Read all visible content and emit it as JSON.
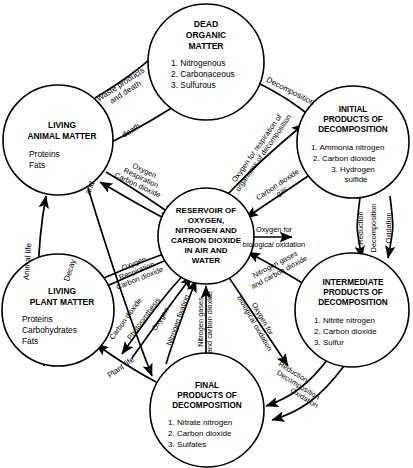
{
  "diagram": {
    "type": "cycle-diagram",
    "colors": {
      "stroke": "#000000",
      "background": "#ffffff",
      "text": "#000000"
    },
    "nodes": [
      {
        "id": "dead-organic-matter",
        "title": [
          "DEAD",
          "ORGANIC",
          "MATTER"
        ],
        "items": [
          "1. Nitrogenous",
          "2. Carbonaceous",
          "3. Sulfurous"
        ],
        "cx": 206,
        "cy": 62,
        "r": 58
      },
      {
        "id": "initial-products-of-decomposition",
        "title": [
          "INITIAL",
          "PRODUCTS OF",
          "DECOMPOSITION"
        ],
        "items": [
          "1. Ammonia nitrogen",
          "2. Carbon dioxide",
          "3. Hydrogen",
          "    sulfide"
        ],
        "cx": 353,
        "cy": 142,
        "r": 56
      },
      {
        "id": "intermediate-products-of-decomposition",
        "title": [
          "INTERMEDIATE",
          "PRODUCTS OF",
          "DECOMPOSITION"
        ],
        "items": [
          "1. Nitrite nitrogen",
          "2. Carbon dioxide",
          "3. Sulfur"
        ],
        "cx": 352,
        "cy": 310,
        "r": 57
      },
      {
        "id": "final-products-of-decomposition",
        "title": [
          "FINAL",
          "PRODUCTS OF",
          "DECOMPOSITION"
        ],
        "items": [
          "1. Nitrate nitrogen",
          "2. Carbon dioxide",
          "3. Sulfates"
        ],
        "cx": 207,
        "cy": 410,
        "r": 57
      },
      {
        "id": "living-plant-matter",
        "title": [
          "LIVING",
          "PLANT MATTER"
        ],
        "items": [
          "Proteins",
          "Carbohydrates",
          "Fats"
        ],
        "cx": 58,
        "cy": 310,
        "r": 56
      },
      {
        "id": "living-animal-matter",
        "title": [
          "LIVING",
          "ANIMAL MATTER"
        ],
        "items": [
          "Proteins",
          "Fats"
        ],
        "cx": 58,
        "cy": 140,
        "r": 55
      },
      {
        "id": "reservoir",
        "title": [
          "RESERVOIR OF",
          "OXYGEN,",
          "NITROGEN AND",
          "CARBON DIOXIDE",
          "IN AIR AND",
          "WATER"
        ],
        "items": [],
        "cx": 206,
        "cy": 236,
        "r": 48
      }
    ],
    "edge_labels": [
      {
        "id": "waste-products-and-death",
        "lines": [
          "Waste products",
          "and death"
        ]
      },
      {
        "id": "death",
        "lines": [
          "death"
        ]
      },
      {
        "id": "decomposition-top",
        "lines": [
          "Decomposition"
        ]
      },
      {
        "id": "oxygen-for-respiration-of-organisms-of-decomposition",
        "lines": [
          "Oxygen for respiration of",
          "organisms of decomposition"
        ]
      },
      {
        "id": "carbon-dioxide-gas",
        "lines": [
          "Carbon dioxide",
          "gas"
        ]
      },
      {
        "id": "oxygen-respiration-carbon-dioxide-animal",
        "lines": [
          "Oxygen",
          "Respiration",
          "Carbon dioxide"
        ]
      },
      {
        "id": "animal-life",
        "lines": [
          "Animal life"
        ]
      },
      {
        "id": "decay-and",
        "lines": [
          "Decay",
          "and"
        ]
      },
      {
        "id": "oxygen-respiration-carbon-dioxide-plant",
        "lines": [
          "Oxygen",
          "Respiration",
          "Carbon dioxide"
        ]
      },
      {
        "id": "carbon-dioxide-photosynthesis-oxygen",
        "lines": [
          "Carbon dioxide",
          "Photosynthesis",
          "Oxygen"
        ]
      },
      {
        "id": "nitrogen-fixation",
        "lines": [
          "Nitrogen fixation"
        ]
      },
      {
        "id": "nitrogen-gases-and-carbon-dioxide-left",
        "lines": [
          "Nitrogen gases",
          "and carbon dioxide"
        ]
      },
      {
        "id": "oxygen-for-biological-oxidation-diagonal",
        "lines": [
          "Oxygen for",
          "biological oxidation"
        ]
      },
      {
        "id": "nitrogen-gases-and-carbon-dioxide-right",
        "lines": [
          "Nitrogen gases",
          "and carbon dioxide"
        ]
      },
      {
        "id": "oxygen-for-biological-oxidation-horizontal",
        "lines": [
          "Oxygen for",
          "biological oxidation"
        ]
      },
      {
        "id": "reduction-right",
        "lines": [
          "Reduction"
        ]
      },
      {
        "id": "decomposition-right",
        "lines": [
          "Decomposition"
        ]
      },
      {
        "id": "oxidation-right",
        "lines": [
          "Oxidation"
        ]
      },
      {
        "id": "reduction-bottom",
        "lines": [
          "Reduction"
        ]
      },
      {
        "id": "decomposition-bottom",
        "lines": [
          "Decomposition"
        ]
      },
      {
        "id": "oxidation-bottom",
        "lines": [
          "Oxidation"
        ]
      },
      {
        "id": "plant-life",
        "lines": [
          "Plant life"
        ]
      }
    ]
  }
}
